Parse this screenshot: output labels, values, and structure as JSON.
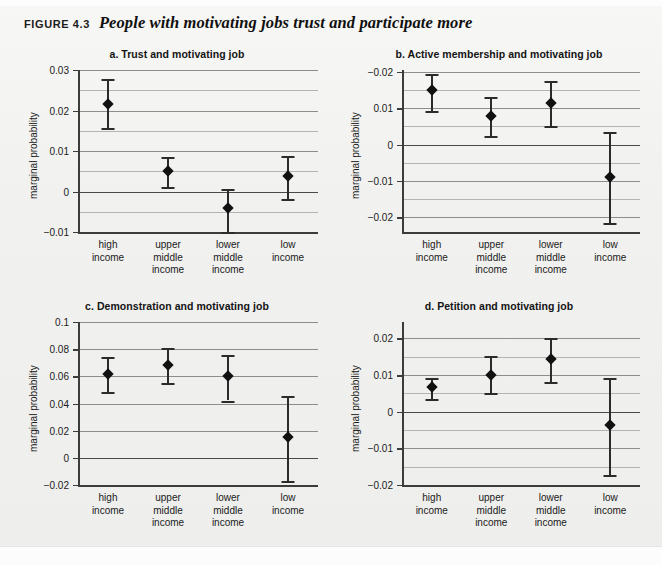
{
  "figure": {
    "number_label": "FIGURE 4.3",
    "title": "People with motivating jobs trust and participate more"
  },
  "categories": [
    "high income",
    "upper middle income",
    "lower middle income",
    "low income"
  ],
  "chart_data": [
    {
      "id": "a",
      "type": "scatter",
      "title": "a.  Trust and motivating job",
      "xlabel": "",
      "ylabel": "marginal probability",
      "categories": [
        "high\nincome",
        "upper\nmiddle\nincome",
        "lower\nmiddle\nincome",
        "low\nincome"
      ],
      "tick_labels": [
        "0.03",
        "0.02",
        "0.01",
        "0",
        "−0.01"
      ],
      "tick_values": [
        0.03,
        0.02,
        0.01,
        0,
        -0.01
      ],
      "minor_ticks": [
        0.025,
        0.015,
        0.005,
        -0.005
      ],
      "ylim": [
        -0.01,
        0.03
      ],
      "grid": true,
      "values": [
        0.0216,
        0.005,
        -0.004,
        0.0038
      ],
      "err_low": [
        0.0156,
        0.0012,
        -0.0099,
        -0.0018
      ],
      "err_high": [
        0.0278,
        0.0084,
        0.0007,
        0.0087
      ]
    },
    {
      "id": "b",
      "type": "scatter",
      "title": "b.  Active membership and motivating job",
      "xlabel": "",
      "ylabel": "marginal probability",
      "categories": [
        "high\nincome",
        "upper\nmiddle\nincome",
        "lower\nmiddle\nincome",
        "low\nincome"
      ],
      "tick_labels": [
        "−0.02",
        "0.01",
        "0",
        "−0.01",
        "−0.02"
      ],
      "tick_values": [
        0.02,
        0.01,
        0,
        -0.01,
        -0.02
      ],
      "minor_ticks": [
        0.015,
        0.005,
        -0.005,
        -0.015
      ],
      "ylim": [
        -0.024,
        0.0205
      ],
      "grid": true,
      "values": [
        0.015,
        0.008,
        0.0113,
        -0.009
      ],
      "err_low": [
        0.0092,
        0.0025,
        0.005,
        -0.0215
      ],
      "err_high": [
        0.0195,
        0.013,
        0.0175,
        0.0035
      ]
    },
    {
      "id": "c",
      "type": "scatter",
      "title": "c.  Demonstration and motivating job",
      "xlabel": "",
      "ylabel": "marginal probability",
      "categories": [
        "high\nincome",
        "upper\nmiddle\nincome",
        "lower\nmiddle\nincome",
        "low\nincome"
      ],
      "tick_labels": [
        "0.1",
        "0.08",
        "0.06",
        "0.04",
        "0.02",
        "0",
        "−0.02"
      ],
      "tick_values": [
        0.1,
        0.08,
        0.06,
        0.04,
        0.02,
        0,
        -0.02
      ],
      "minor_ticks": [],
      "ylim": [
        -0.02,
        0.1
      ],
      "grid": true,
      "values": [
        0.062,
        0.068,
        0.06,
        0.0152
      ],
      "err_low": [
        0.0488,
        0.055,
        0.0422,
        -0.0167
      ],
      "err_high": [
        0.074,
        0.081,
        0.0755,
        0.0452
      ]
    },
    {
      "id": "d",
      "type": "scatter",
      "title": "d.  Petition and motivating job",
      "xlabel": "",
      "ylabel": "marginal probability",
      "categories": [
        "high\nincome",
        "upper\nmiddle\nincome",
        "lower\nmiddle\nincome",
        "low\nincome"
      ],
      "tick_labels": [
        "0.02",
        "0.01",
        "0",
        "−0.01",
        "−0.02"
      ],
      "tick_values": [
        0.02,
        0.01,
        0,
        -0.01,
        -0.02
      ],
      "minor_ticks": [
        0.015,
        0.005,
        -0.005,
        -0.015
      ],
      "ylim": [
        -0.02,
        0.0245
      ],
      "grid": true,
      "values": [
        0.0067,
        0.01,
        0.0145,
        -0.0035
      ],
      "err_low": [
        0.0036,
        0.0051,
        0.0081,
        -0.0173
      ],
      "err_high": [
        0.0093,
        0.0151,
        0.02,
        0.0093
      ]
    }
  ],
  "colors": {
    "marker": "#111111",
    "error_bar": "#2b2b2b",
    "gridline_major": "#8d8d8d",
    "gridline_minor": "#b4b4b4",
    "axis": "#3c3c3c",
    "page_background": "#f1f1ef"
  }
}
